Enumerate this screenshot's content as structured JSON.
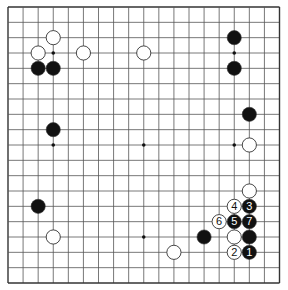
{
  "board": {
    "size": 19,
    "colors": {
      "background": "#ffffff",
      "line": "#555555",
      "edge": "#333333",
      "black": "#111111",
      "white": "#ffffff",
      "stone_outline": "#333333"
    },
    "star_points": [
      [
        3,
        3
      ],
      [
        3,
        9
      ],
      [
        3,
        15
      ],
      [
        9,
        3
      ],
      [
        9,
        9
      ],
      [
        9,
        15
      ],
      [
        15,
        3
      ],
      [
        15,
        9
      ],
      [
        15,
        15
      ]
    ],
    "stones": [
      {
        "color": "white",
        "col": 3,
        "row": 2,
        "label": ""
      },
      {
        "color": "white",
        "col": 2,
        "row": 3,
        "label": ""
      },
      {
        "color": "white",
        "col": 5,
        "row": 3,
        "label": ""
      },
      {
        "color": "white",
        "col": 9,
        "row": 3,
        "label": ""
      },
      {
        "color": "black",
        "col": 2,
        "row": 4,
        "label": ""
      },
      {
        "color": "black",
        "col": 3,
        "row": 4,
        "label": ""
      },
      {
        "color": "black",
        "col": 15,
        "row": 2,
        "label": ""
      },
      {
        "color": "black",
        "col": 15,
        "row": 4,
        "label": ""
      },
      {
        "color": "black",
        "col": 16,
        "row": 7,
        "label": ""
      },
      {
        "color": "white",
        "col": 16,
        "row": 9,
        "label": ""
      },
      {
        "color": "black",
        "col": 3,
        "row": 8,
        "label": ""
      },
      {
        "color": "black",
        "col": 2,
        "row": 13,
        "label": ""
      },
      {
        "color": "white",
        "col": 3,
        "row": 15,
        "label": ""
      },
      {
        "color": "white",
        "col": 11,
        "row": 16,
        "label": ""
      },
      {
        "color": "black",
        "col": 13,
        "row": 15,
        "label": ""
      },
      {
        "color": "white",
        "col": 16,
        "row": 12,
        "label": ""
      },
      {
        "color": "white",
        "col": 15,
        "row": 13,
        "label": "4"
      },
      {
        "color": "black",
        "col": 16,
        "row": 13,
        "label": "3"
      },
      {
        "color": "white",
        "col": 14,
        "row": 14,
        "label": "6"
      },
      {
        "color": "black",
        "col": 15,
        "row": 14,
        "label": "5"
      },
      {
        "color": "black",
        "col": 16,
        "row": 14,
        "label": "7"
      },
      {
        "color": "white",
        "col": 15,
        "row": 15,
        "label": ""
      },
      {
        "color": "black",
        "col": 16,
        "row": 15,
        "label": ""
      },
      {
        "color": "white",
        "col": 15,
        "row": 16,
        "label": "2"
      },
      {
        "color": "black",
        "col": 16,
        "row": 16,
        "label": "1"
      }
    ]
  }
}
